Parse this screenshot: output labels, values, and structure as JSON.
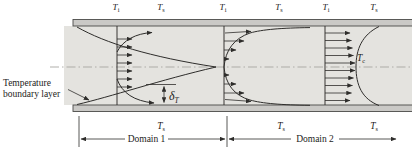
{
  "colors": {
    "wall_fill": "#cac9c6",
    "wall_edge": "#4a4a48",
    "fluid_fill": "#e4e3df",
    "line_color": "#2e2d2b",
    "centerline_color": "#a7a6a2",
    "text_color": "#1d1c1a"
  },
  "top_labels": [
    {
      "base": "T",
      "sub": "i"
    },
    {
      "base": "T",
      "sub": "s"
    },
    {
      "base": "T",
      "sub": "i"
    },
    {
      "base": "T",
      "sub": "s"
    },
    {
      "base": "T",
      "sub": "i"
    },
    {
      "base": "T",
      "sub": "s"
    }
  ],
  "bottom_labels": [
    {
      "base": "T",
      "sub": "s"
    },
    {
      "base": "T",
      "sub": "s"
    },
    {
      "base": "T",
      "sub": "s"
    }
  ],
  "centerline_temperature": {
    "base": "T",
    "sub": "c"
  },
  "boundary_layer_thickness": {
    "base": "δ",
    "sub": "T"
  },
  "callout": {
    "line1": "Temperature",
    "line2": "boundary layer"
  },
  "domains": [
    {
      "label": "Domain 1"
    },
    {
      "label": "Domain 2"
    }
  ]
}
